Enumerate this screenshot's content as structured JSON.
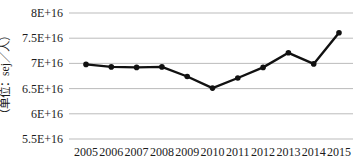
{
  "chart_data": {
    "type": "line",
    "title": "",
    "ylabel": "（单位：sej／人）",
    "xlabel": "",
    "categories": [
      "2005",
      "2006",
      "2007",
      "2008",
      "2009",
      "2010",
      "2011",
      "2012",
      "2013",
      "2014",
      "2015"
    ],
    "series": [
      {
        "name": "per-capita-emergy",
        "values": [
          6.98e+16,
          6.93e+16,
          6.92e+16,
          6.93e+16,
          6.74e+16,
          6.51e+16,
          6.71e+16,
          6.92e+16,
          7.21e+16,
          6.99e+16,
          7.61e+16
        ]
      }
    ],
    "ylim": [
      5.5e+16,
      8e+16
    ],
    "ytick_values": [
      8e+16,
      7.5e+16,
      7e+16,
      6.5e+16,
      6e+16,
      5.5e+16
    ],
    "ytick_labels": [
      "8E+16",
      "7.5E+16",
      "7E+16",
      "6.5E+16",
      "6E+16",
      "5.5E+16"
    ],
    "grid": true,
    "legend_position": "none",
    "marker_style": "filled-circle",
    "colors": {
      "line": "#111111",
      "marker": "#111111",
      "grid": "#b3b3b3",
      "text": "#1c1c1c",
      "background": "#ffffff"
    }
  }
}
